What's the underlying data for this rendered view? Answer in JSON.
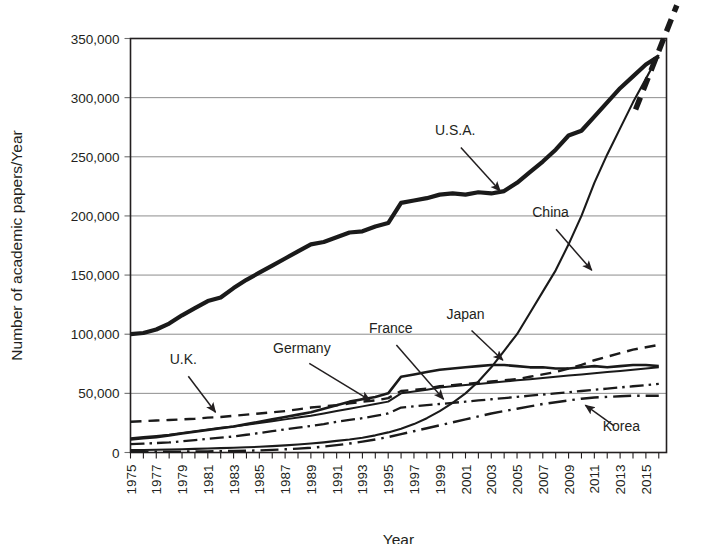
{
  "figure": {
    "name": "academic-papers-per-year-by-country",
    "background_color": "#ffffff",
    "ink_color": "#1a1a1a",
    "grid_color": "#8d8d8d"
  },
  "chart_data": {
    "type": "line",
    "title": "",
    "xlabel": "Year",
    "ylabel": "Number of academic papers/Year",
    "xlim": [
      1975,
      2016.6
    ],
    "ylim": [
      0,
      350000
    ],
    "ytick_values": [
      0,
      50000,
      100000,
      150000,
      200000,
      250000,
      300000,
      350000
    ],
    "ytick_labels": [
      "0",
      "50,000",
      "100,000",
      "150,000",
      "200,000",
      "250,000",
      "300,000",
      "350,000"
    ],
    "xtick_labels": [
      "1975",
      "1977",
      "1979",
      "1981",
      "1983",
      "1985",
      "1987",
      "1989",
      "1991",
      "1993",
      "1995",
      "1997",
      "1999",
      "2001",
      "2003",
      "2005",
      "2007",
      "2009",
      "2011",
      "2013",
      "2015"
    ],
    "xtick_step": 2,
    "xtick_minor_step": 1,
    "grid": "horizontal",
    "legend_position": "inline-annotations",
    "x": [
      1975,
      1976,
      1977,
      1978,
      1979,
      1980,
      1981,
      1982,
      1983,
      1984,
      1985,
      1986,
      1987,
      1988,
      1989,
      1990,
      1991,
      1992,
      1993,
      1994,
      1995,
      1996,
      1997,
      1998,
      1999,
      2000,
      2001,
      2002,
      2003,
      2004,
      2005,
      2006,
      2007,
      2008,
      2009,
      2010,
      2011,
      2012,
      2013,
      2014,
      2015,
      2016
    ],
    "series": [
      {
        "name": "U.S.A.",
        "style": "solid-thick",
        "stroke_width": 4.2,
        "dash": "none",
        "values": [
          100000,
          101000,
          104000,
          109000,
          116000,
          122000,
          128000,
          131000,
          139000,
          146000,
          152000,
          158000,
          164000,
          170000,
          176000,
          178000,
          182000,
          186000,
          187000,
          191000,
          194000,
          211000,
          213000,
          215000,
          218000,
          219000,
          218000,
          220000,
          219000,
          221000,
          228000,
          237000,
          246000,
          256000,
          268000,
          272000,
          284000,
          296000,
          308000,
          318000,
          328000,
          335000
        ]
      },
      {
        "name": "China",
        "style": "solid-thin",
        "stroke_width": 2.1,
        "dash": "none",
        "values": [
          2000,
          2100,
          2300,
          2500,
          2800,
          3100,
          3400,
          3700,
          4000,
          4400,
          4800,
          5400,
          6000,
          6800,
          7600,
          8600,
          9800,
          11000,
          12500,
          14500,
          17000,
          20000,
          24000,
          29000,
          35000,
          42000,
          50000,
          60000,
          72000,
          86000,
          100000,
          118000,
          136000,
          154000,
          176000,
          200000,
          228000,
          252000,
          274000,
          296000,
          316000,
          336000
        ]
      },
      {
        "name": "Japan",
        "style": "solid-medium",
        "stroke_width": 2.6,
        "dash": "none",
        "values": [
          11000,
          12000,
          13000,
          14500,
          16000,
          17500,
          19000,
          20500,
          22000,
          24000,
          26000,
          28000,
          30000,
          32000,
          34000,
          37000,
          40000,
          43000,
          45000,
          47000,
          50000,
          64000,
          66000,
          68000,
          70000,
          71000,
          72000,
          73000,
          74000,
          74000,
          73000,
          72000,
          72000,
          71000,
          71000,
          72000,
          73000,
          72000,
          73000,
          74000,
          74000,
          73000
        ]
      },
      {
        "name": "U.K.",
        "style": "dashed",
        "stroke_width": 2.4,
        "dash": "11 7",
        "values": [
          26000,
          26500,
          27000,
          27500,
          28000,
          28500,
          29500,
          30000,
          31000,
          32000,
          33000,
          34000,
          35000,
          36500,
          38000,
          39000,
          40000,
          41500,
          43000,
          44000,
          46000,
          52000,
          53000,
          54000,
          56000,
          57000,
          58000,
          59000,
          60000,
          61000,
          62000,
          64000,
          66000,
          68000,
          71000,
          74000,
          78000,
          81000,
          84000,
          87000,
          89000,
          91000
        ]
      },
      {
        "name": "Germany",
        "style": "solid-thin",
        "stroke_width": 2.0,
        "dash": "none",
        "values": [
          12000,
          13000,
          14000,
          15000,
          16500,
          18000,
          19500,
          21000,
          22000,
          23500,
          25000,
          26500,
          28000,
          29500,
          31000,
          33000,
          35000,
          37000,
          39000,
          41000,
          43000,
          50000,
          51500,
          53000,
          55000,
          56000,
          57000,
          58000,
          59000,
          60000,
          61000,
          62000,
          63000,
          64000,
          65000,
          66000,
          67000,
          68000,
          69000,
          70000,
          71000,
          72000
        ]
      },
      {
        "name": "France",
        "style": "dash-dot",
        "stroke_width": 2.3,
        "dash": "14 5 2.5 5",
        "values": [
          7000,
          7500,
          8000,
          8500,
          9500,
          10500,
          11500,
          12500,
          13500,
          15000,
          16500,
          18000,
          19500,
          21000,
          22500,
          24000,
          26000,
          27500,
          29000,
          31000,
          33000,
          38000,
          39000,
          40000,
          41000,
          42000,
          43000,
          44000,
          45000,
          46000,
          47000,
          48000,
          49000,
          50000,
          51000,
          52000,
          53000,
          54000,
          55000,
          56000,
          57000,
          58000
        ]
      },
      {
        "name": "Korea",
        "style": "dash-dot-long",
        "stroke_width": 2.4,
        "dash": "18 6 2.5 6",
        "values": [
          500,
          550,
          600,
          650,
          750,
          850,
          950,
          1100,
          1300,
          1500,
          1800,
          2200,
          2700,
          3300,
          4000,
          5000,
          6200,
          7600,
          9200,
          11000,
          13000,
          15500,
          18000,
          20500,
          23000,
          25500,
          28000,
          30500,
          33000,
          35000,
          37000,
          39000,
          41000,
          42500,
          44000,
          45500,
          46500,
          47000,
          47500,
          48000,
          48000,
          48000
        ]
      }
    ],
    "extrapolation": {
      "name": "projection-dashed",
      "style": "dashed-thick-gray",
      "stroke_width": 5.5,
      "dash": "13 8",
      "color": "#5a5a5a",
      "x": [
        2014.2,
        2017.4
      ],
      "values": [
        290000,
        378000
      ]
    },
    "annotations": [
      {
        "label": "U.S.A.",
        "label_x": 2000.2,
        "label_y": 268000,
        "anchor": "middle",
        "arrow_to_x": 2003.7,
        "arrow_to_y": 221000
      },
      {
        "label": "China",
        "label_x": 2007.6,
        "label_y": 199000,
        "anchor": "middle",
        "arrow_to_x": 2010.8,
        "arrow_to_y": 154000
      },
      {
        "label": "Japan",
        "label_x": 2001.0,
        "label_y": 113000,
        "anchor": "middle",
        "arrow_to_x": 2003.9,
        "arrow_to_y": 78000
      },
      {
        "label": "France",
        "label_x": 1995.2,
        "label_y": 101000,
        "anchor": "middle",
        "arrow_to_x": 1999.3,
        "arrow_to_y": 45000
      },
      {
        "label": "Germany",
        "label_x": 1988.3,
        "label_y": 84000,
        "anchor": "middle",
        "arrow_to_x": 1993.6,
        "arrow_to_y": 44000
      },
      {
        "label": "U.K.",
        "label_x": 1979.1,
        "label_y": 75000,
        "anchor": "middle",
        "arrow_to_x": 1981.6,
        "arrow_to_y": 34000
      },
      {
        "label": "Korea",
        "label_x": 2013.1,
        "label_y": 18000,
        "anchor": "middle",
        "arrow_to_x": 2010.3,
        "arrow_to_y": 40000
      }
    ]
  }
}
